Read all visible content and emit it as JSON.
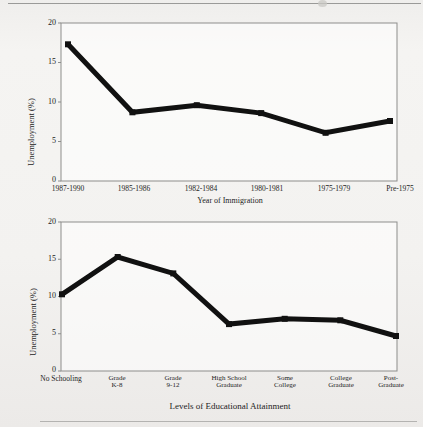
{
  "document": {
    "background_color": "#f2f1ef",
    "line_color": "#111111",
    "frame_color": "#8d8d8b"
  },
  "chart_data": [
    {
      "id": "immigration",
      "type": "line",
      "title": "",
      "xlabel": "Year of Immigration",
      "ylabel": "Unemployment (%)",
      "categories": [
        "1987-1990",
        "1985-1986",
        "1982-1984",
        "1980-1981",
        "1975-1979",
        "Pre-1975"
      ],
      "values": [
        17.3,
        8.7,
        9.6,
        8.6,
        6.1,
        7.6
      ],
      "ylim": [
        0,
        20
      ],
      "yticks": [
        0,
        5,
        10,
        15,
        20
      ],
      "ytick_labels": [
        "0",
        "5",
        "10",
        "15",
        "20"
      ],
      "grid": false,
      "legend": "none",
      "marker": "square",
      "line_color": "#111111",
      "line_width": 5
    },
    {
      "id": "education",
      "type": "line",
      "title": "",
      "xlabel": "Levels of Educational Attainment",
      "ylabel": "Unemployment (%)",
      "categories": [
        "No Schooling",
        "Grade\nK-8",
        "Grade\n9-12",
        "High School\nGraduate",
        "Some\nCollege",
        "College\nGraduate",
        "Post-\nGraduate"
      ],
      "values": [
        10.3,
        15.3,
        13.1,
        6.3,
        7.0,
        6.8,
        4.7
      ],
      "ylim": [
        0,
        20
      ],
      "yticks": [
        0,
        5,
        10,
        15,
        20
      ],
      "ytick_labels": [
        "0",
        "5",
        "10",
        "15",
        "20"
      ],
      "grid": false,
      "legend": "none",
      "marker": "square",
      "line_color": "#111111",
      "line_width": 5
    }
  ]
}
